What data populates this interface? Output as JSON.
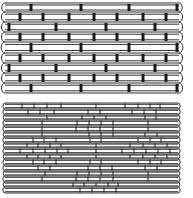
{
  "figure": {
    "stroke_color": "#1a1a1a",
    "background": "#ffffff"
  },
  "panels": [
    {
      "name": "top-panel",
      "x_start": 5,
      "x_end": 179,
      "tie_style": "thick-block",
      "tie_width": 3,
      "bands": [
        {
          "y0": 3,
          "y1": 12,
          "ties": [
            31,
            81,
            129,
            177
          ]
        },
        {
          "y0": 12,
          "y1": 22,
          "ties": [
            20,
            43,
            69,
            94,
            117,
            143,
            166
          ]
        },
        {
          "y0": 22,
          "y1": 32,
          "ties": [
            9,
            56,
            106,
            155
          ]
        },
        {
          "y0": 32,
          "y1": 42,
          "ties": [
            20,
            43,
            69,
            94,
            117,
            143,
            166
          ]
        },
        {
          "y0": 42,
          "y1": 53,
          "ties": [
            31,
            81,
            129,
            177
          ]
        },
        {
          "y0": 53,
          "y1": 63,
          "ties": [
            20,
            43,
            69,
            94,
            117,
            143,
            166
          ]
        },
        {
          "y0": 63,
          "y1": 73,
          "ties": [
            9,
            56,
            106,
            155
          ]
        },
        {
          "y0": 73,
          "y1": 83,
          "ties": [
            20,
            43,
            69,
            94,
            117,
            143,
            166
          ]
        },
        {
          "y0": 83,
          "y1": 93,
          "ties": [
            31,
            81,
            129,
            177
          ]
        }
      ]
    },
    {
      "name": "bottom-panel",
      "x_start": 5,
      "x_end": 178,
      "tie_style": "thin-line",
      "tie_width": 1,
      "bands": [
        {
          "y0": 103,
          "y1": 109,
          "ties": [
            22,
            34,
            47,
            61,
            96,
            125,
            138,
            150,
            160
          ]
        },
        {
          "y0": 109,
          "y1": 115,
          "ties": [
            28,
            40,
            54,
            88,
            100,
            132,
            144,
            156
          ]
        },
        {
          "y0": 115,
          "y1": 120,
          "ties": [
            47,
            82,
            94,
            106,
            145,
            156
          ]
        },
        {
          "y0": 120,
          "y1": 126,
          "ties": [
            42,
            77,
            89,
            101,
            113,
            148
          ]
        },
        {
          "y0": 126,
          "y1": 132,
          "ties": [
            42,
            76,
            88,
            100,
            113,
            148
          ]
        },
        {
          "y0": 132,
          "y1": 137,
          "ties": [
            42,
            89,
            101,
            113,
            145,
            157
          ]
        },
        {
          "y0": 137,
          "y1": 143,
          "ties": [
            33,
            44,
            56,
            90,
            101,
            138,
            150,
            161
          ]
        },
        {
          "y0": 143,
          "y1": 148,
          "ties": [
            27,
            38,
            50,
            61,
            96,
            130,
            143,
            155,
            167
          ]
        },
        {
          "y0": 148,
          "y1": 154,
          "ties": [
            20,
            33,
            45,
            57,
            68,
            96,
            122,
            134,
            146,
            158,
            170
          ]
        },
        {
          "y0": 154,
          "y1": 159,
          "ties": [
            27,
            38,
            50,
            61,
            96,
            130,
            143,
            155,
            167
          ]
        },
        {
          "y0": 159,
          "y1": 165,
          "ties": [
            33,
            44,
            56,
            90,
            101,
            138,
            150,
            161
          ]
        },
        {
          "y0": 165,
          "y1": 171,
          "ties": [
            38,
            50,
            88,
            100,
            112,
            145,
            157
          ]
        },
        {
          "y0": 171,
          "y1": 176,
          "ties": [
            45,
            77,
            89,
            101,
            113,
            148
          ]
        },
        {
          "y0": 176,
          "y1": 182,
          "ties": [
            42,
            76,
            88,
            100,
            113,
            148
          ]
        },
        {
          "y0": 182,
          "y1": 187,
          "ties": [
            73,
            84,
            96,
            108,
            118
          ]
        },
        {
          "y0": 187,
          "y1": 193,
          "ties": [
            80,
            92,
            104,
            116
          ]
        }
      ]
    }
  ]
}
